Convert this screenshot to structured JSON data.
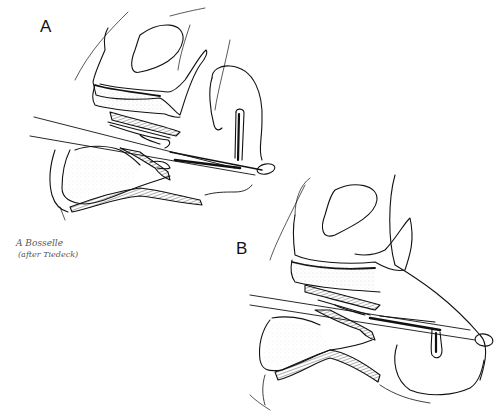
{
  "figure": {
    "panels": [
      {
        "id": "A",
        "label": "A"
      },
      {
        "id": "B",
        "label": "B"
      }
    ],
    "signature": {
      "line1": "A Bosselle",
      "line2": "(after Tiedeck)"
    },
    "colors": {
      "background": "#ffffff",
      "ink": "#111111",
      "hatch": "#333333",
      "stipple": "#999999"
    }
  }
}
